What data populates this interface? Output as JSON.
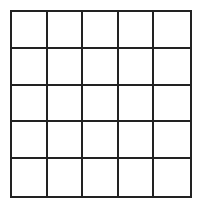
{
  "grid": {
    "rows": 5,
    "columns": 5,
    "line_color": "#222222",
    "background_color": "#ffffff",
    "cells": [
      [
        "",
        "",
        "",
        "",
        ""
      ],
      [
        "",
        "",
        "",
        "",
        ""
      ],
      [
        "",
        "",
        "",
        "",
        ""
      ],
      [
        "",
        "",
        "",
        "",
        ""
      ],
      [
        "",
        "",
        "",
        "",
        ""
      ]
    ]
  }
}
